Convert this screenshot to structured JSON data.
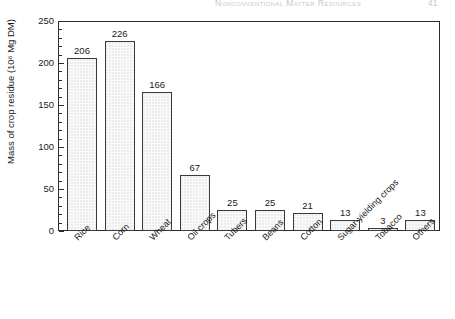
{
  "running_head": {
    "title": "Nonconventional Matter Resources",
    "page_number": "41"
  },
  "chart_data": {
    "type": "bar",
    "title": "",
    "xlabel": "",
    "ylabel": "Mass of crop residue (10⁶ Mg DM)",
    "categories": [
      "Rice",
      "Corn",
      "Wheat",
      "Oil crops",
      "Tubers",
      "Beans",
      "Cotton",
      "Sugar-yielding crops",
      "Tobacco",
      "Others"
    ],
    "values": [
      206,
      226,
      166,
      67,
      25,
      25,
      21,
      13,
      3,
      13
    ],
    "value_labels": [
      "206",
      "226",
      "166",
      "67",
      "25",
      "25",
      "21",
      "13",
      "3",
      "13"
    ],
    "ylim": [
      0,
      250
    ],
    "ytick_labels": [
      "0",
      "50",
      "100",
      "150",
      "200",
      "250"
    ],
    "ytick_values": [
      0,
      50,
      100,
      150,
      200,
      250
    ],
    "ytick_minor_step": 10,
    "grid": false,
    "legend": null,
    "bar_fill_color": "#fbfbfb",
    "bar_edge_color": "#3a3a3a",
    "axis_color": "#2b2b2b"
  }
}
